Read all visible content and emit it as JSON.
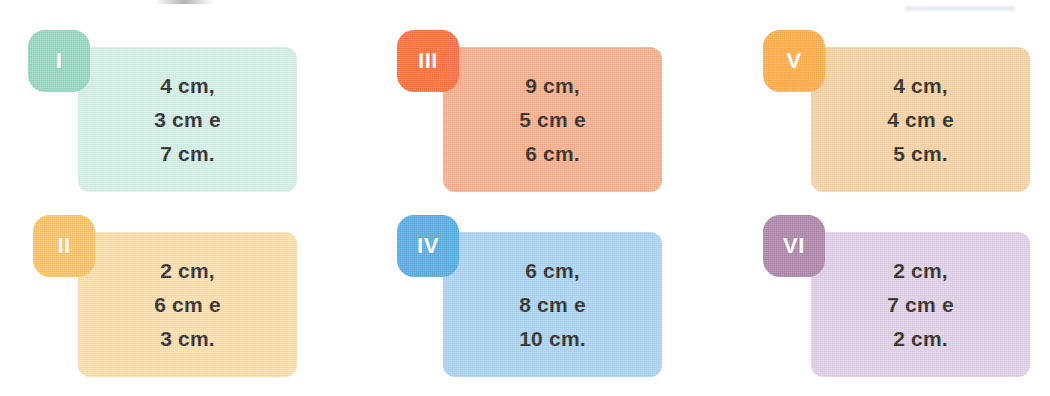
{
  "page": {
    "background_color": "#ffffff",
    "text_color": "#231f1c",
    "width": 1050,
    "height": 396
  },
  "cards": [
    {
      "id": "card-1",
      "tag_label": "I",
      "tag_color": "#8ed3bd",
      "body_color": "#cfeee3",
      "lines": [
        "4 cm,",
        "3 cm e",
        "7 cm."
      ],
      "measurements": [
        "4 cm",
        "3 cm",
        "7 cm"
      ],
      "position": {
        "left": 78,
        "top": 47,
        "width": 219,
        "height": 145
      },
      "tag_position": {
        "left": 28,
        "top": 30
      }
    },
    {
      "id": "card-2",
      "tag_label": "II",
      "tag_color": "#f8bf58",
      "body_color": "#f9dca4",
      "lines": [
        "2 cm,",
        "6 cm e",
        "3 cm."
      ],
      "measurements": [
        "2 cm",
        "6 cm",
        "3 cm"
      ],
      "position": {
        "left": 78,
        "top": 232,
        "width": 219,
        "height": 145
      },
      "tag_position": {
        "left": 33,
        "top": 215
      }
    },
    {
      "id": "card-3",
      "tag_label": "III",
      "tag_color": "#f06a3c",
      "body_color": "#f2ab8a",
      "lines": [
        "9 cm,",
        "5 cm e",
        "6 cm."
      ],
      "measurements": [
        "9 cm",
        "5 cm",
        "6 cm"
      ],
      "position": {
        "left": 443,
        "top": 47,
        "width": 219,
        "height": 145
      },
      "tag_position": {
        "left": 397,
        "top": 30
      }
    },
    {
      "id": "card-4",
      "tag_label": "IV",
      "tag_color": "#4da8dd",
      "body_color": "#a6cfee",
      "lines": [
        "6 cm,",
        "8 cm e",
        "10 cm."
      ],
      "measurements": [
        "6 cm",
        "8 cm",
        "10 cm"
      ],
      "position": {
        "left": 443,
        "top": 232,
        "width": 219,
        "height": 145
      },
      "tag_position": {
        "left": 397,
        "top": 215
      }
    },
    {
      "id": "card-5",
      "tag_label": "V",
      "tag_color": "#f5a94d",
      "body_color": "#f3cfa2",
      "lines": [
        "4 cm,",
        "4 cm e",
        "5 cm."
      ],
      "measurements": [
        "4 cm",
        "4 cm",
        "5 cm"
      ],
      "position": {
        "left": 811,
        "top": 47,
        "width": 219,
        "height": 145
      },
      "tag_position": {
        "left": 763,
        "top": 30
      }
    },
    {
      "id": "card-6",
      "tag_label": "VI",
      "tag_color": "#a87fa5",
      "body_color": "#ddcde3",
      "lines": [
        "2 cm,",
        "7 cm e",
        "2 cm."
      ],
      "measurements": [
        "2 cm",
        "7 cm",
        "2 cm"
      ],
      "position": {
        "left": 811,
        "top": 232,
        "width": 219,
        "height": 145
      },
      "tag_position": {
        "left": 763,
        "top": 215
      }
    }
  ]
}
